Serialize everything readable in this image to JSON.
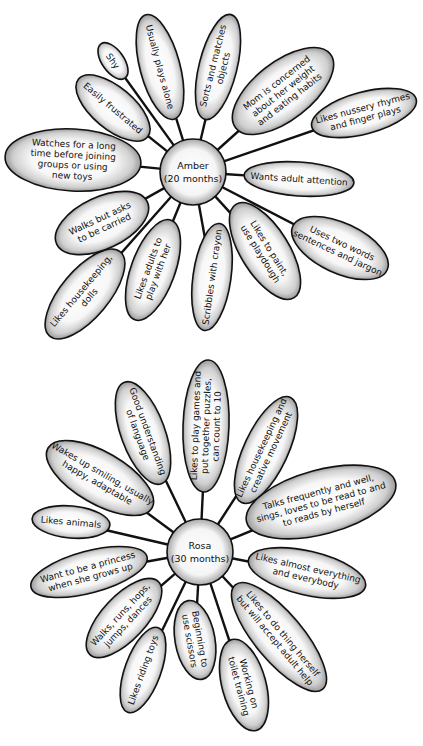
{
  "diagrams": [
    {
      "hub": {
        "name": "Amber",
        "age": "(20 months)"
      },
      "petals": [
        {
          "lines": [
            "Shy"
          ]
        },
        {
          "lines": [
            "Usually plays alone"
          ]
        },
        {
          "lines": [
            "Sorts and matches",
            "objects"
          ]
        },
        {
          "lines": [
            "Mom is concerned",
            "about her weight",
            "and eating habits"
          ]
        },
        {
          "lines": [
            "Likes nussery rhymes",
            "and finger plays"
          ]
        },
        {
          "lines": [
            "Wants adult attention"
          ]
        },
        {
          "lines": [
            "Uses two words",
            "sentences and jargon"
          ]
        },
        {
          "lines": [
            "Likes to paint,",
            "use playdough"
          ]
        },
        {
          "lines": [
            "Scribbles with crayon"
          ]
        },
        {
          "lines": [
            "Likes adults to",
            "play with her"
          ]
        },
        {
          "lines": [
            "Likes housekeeping,",
            "dolls"
          ]
        },
        {
          "lines": [
            "Walks but asks",
            "to be carried"
          ]
        },
        {
          "lines": [
            "Watches for a long",
            "time before joining",
            "groups or using",
            "new toys"
          ]
        },
        {
          "lines": [
            "Easily frustrated"
          ]
        }
      ]
    },
    {
      "hub": {
        "name": "Rosa",
        "age": "(30 months)"
      },
      "petals": [
        {
          "lines": [
            "Likes to play games and",
            "put together puzzles,",
            "can count to 10"
          ]
        },
        {
          "lines": [
            "Good understanding",
            "of language"
          ]
        },
        {
          "lines": [
            "Likes housekeeping and",
            "creative movement"
          ]
        },
        {
          "lines": [
            "Talks frequently and well,",
            "sings, loves to be read to and",
            "to reads by herself"
          ]
        },
        {
          "lines": [
            "Wakes up smiling, usually",
            "happy, adaptable"
          ]
        },
        {
          "lines": [
            "Likes animals"
          ]
        },
        {
          "lines": [
            "Want to be a princess",
            "when she grows up"
          ]
        },
        {
          "lines": [
            "Likes almost everything",
            "and everybody"
          ]
        },
        {
          "lines": [
            "Walks, runs, hops,",
            "jumps, dances"
          ]
        },
        {
          "lines": [
            "Beginning to",
            "use scissors"
          ]
        },
        {
          "lines": [
            "Likes to do thing herself",
            "but will accept adult help"
          ]
        },
        {
          "lines": [
            "Likes riding toys"
          ]
        },
        {
          "lines": [
            "Working on",
            "toilet training"
          ]
        }
      ]
    }
  ]
}
